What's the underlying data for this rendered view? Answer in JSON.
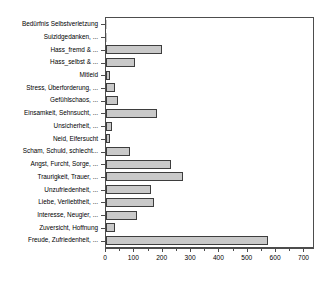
{
  "chart_data": {
    "type": "bar",
    "orientation": "horizontal",
    "title": "",
    "xlabel": "",
    "ylabel": "",
    "xlim": [
      0,
      730
    ],
    "xticks": [
      0,
      100,
      200,
      300,
      400,
      500,
      600,
      700
    ],
    "xtick_labels": [
      "0",
      "100",
      "200",
      "300",
      "400",
      "500",
      "600",
      "700"
    ],
    "minor_tick_step": 50,
    "grid": false,
    "legend": false,
    "bar_fill_color": "#c9c9c9",
    "bar_edge_color": "#3d3d3d",
    "axis_color": "#4d4d4d",
    "categories": [
      "Bedürfnis Selbstverletzung",
      "Suizidgedanken, ...",
      "Hass_fremd & ...",
      "Hass_selbst & ...",
      "Mitleid",
      "Stress, Überforderung, ...",
      "Gefühlschaos, ...",
      "Einsamkeit, Sehnsucht, ...",
      "Unsicherheit, ...",
      "Neid, Eifersucht",
      "Scham, Schuld, schlecht...",
      "Angst, Furcht, Sorge, ...",
      "Traurigkeit, Trauer, ...",
      "Unzufriedenheit, ...",
      "Liebe, Verliebtheit, ...",
      "Interesse, Neugier, ...",
      "Zuversicht, Hoffnung",
      "Freude, Zufriedenheit, ..."
    ],
    "values": [
      2,
      4,
      198,
      102,
      15,
      30,
      42,
      180,
      22,
      15,
      85,
      230,
      270,
      160,
      170,
      110,
      30,
      570
    ]
  }
}
